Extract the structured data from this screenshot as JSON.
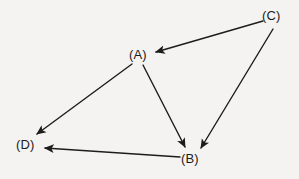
{
  "figure": {
    "kind": "directed-graph-diagram",
    "width": 299,
    "height": 179,
    "background_color": "#f4f3f1",
    "stroke_color": "#1c1c1c",
    "text_color": "#1c1c1c"
  },
  "nodes": [
    {
      "id": "A",
      "label": "(A)",
      "x": 141,
      "y": 55,
      "label_left": 129,
      "label_top": 48
    },
    {
      "id": "B",
      "label": "(B)",
      "x": 193,
      "y": 159,
      "label_left": 181,
      "label_top": 152
    },
    {
      "id": "C",
      "label": "(C)",
      "x": 274,
      "y": 16,
      "label_left": 262,
      "label_top": 9
    },
    {
      "id": "D",
      "label": "(D)",
      "x": 28,
      "y": 145,
      "label_left": 16,
      "label_top": 138
    }
  ],
  "edges": [
    {
      "id": "C-A",
      "from": "C",
      "to": "A",
      "directed": true,
      "x1": 263,
      "y1": 21,
      "x2": 156,
      "y2": 52
    },
    {
      "id": "C-B",
      "from": "C",
      "to": "B",
      "directed": true,
      "x1": 273,
      "y1": 29,
      "x2": 201,
      "y2": 148
    },
    {
      "id": "A-D",
      "from": "A",
      "to": "D",
      "directed": true,
      "x1": 132,
      "y1": 64,
      "x2": 37,
      "y2": 134
    },
    {
      "id": "A-B",
      "from": "A",
      "to": "B",
      "directed": true,
      "x1": 143,
      "y1": 65,
      "x2": 185,
      "y2": 147
    },
    {
      "id": "B-D",
      "from": "B",
      "to": "D",
      "directed": true,
      "x1": 180,
      "y1": 157,
      "x2": 45,
      "y2": 148
    }
  ]
}
